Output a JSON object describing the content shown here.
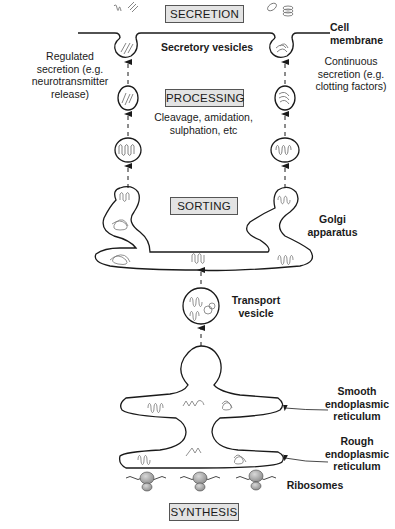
{
  "stages": {
    "secretion": "SECRETION",
    "processing": "PROCESSING",
    "sorting": "SORTING",
    "synthesis": "SYNTHESIS"
  },
  "labels": {
    "cell_membrane_1": "Cell",
    "cell_membrane_2": "membrane",
    "secretory_vesicles": "Secretory vesicles",
    "regulated_1": "Regulated",
    "regulated_2": "secretion (e.g.",
    "regulated_3": "neurotransmitter",
    "regulated_4": "release)",
    "continuous_1": "Continuous",
    "continuous_2": "secretion (e.g.",
    "continuous_3": "clotting factors)",
    "processing_note_1": "Cleavage, amidation,",
    "processing_note_2": "sulphation, etc",
    "golgi_1": "Golgi",
    "golgi_2": "apparatus",
    "transport_1": "Transport",
    "transport_2": "vesicle",
    "ser_1": "Smooth",
    "ser_2": "endoplasmic",
    "ser_3": "reticulum",
    "rer_1": "Rough",
    "rer_2": "endoplasmic",
    "rer_3": "reticulum",
    "ribosomes": "Ribosomes"
  },
  "colors": {
    "stroke": "#1a1a1a",
    "box_fill": "#e3e3e3",
    "protein": "#777777",
    "ribosome": "#9a9a9a"
  }
}
